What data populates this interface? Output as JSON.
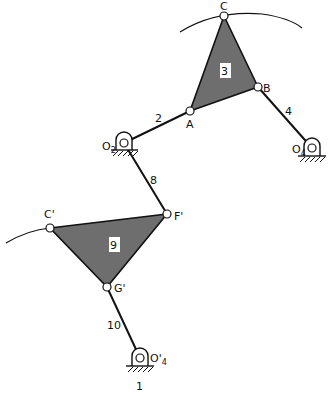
{
  "diagram": {
    "type": "linkage mechanism",
    "colors": {
      "plate_fill": "#6e6e6e",
      "line": "#111111",
      "background": "#ffffff"
    },
    "joints": {
      "C": {
        "label": "C",
        "x": 224,
        "y": 16
      },
      "B": {
        "label": "B",
        "x": 258,
        "y": 87
      },
      "A": {
        "label": "A",
        "x": 190,
        "y": 111
      },
      "O2": {
        "label": "O",
        "sub": "2",
        "x": 124,
        "y": 143
      },
      "O4": {
        "label": "O",
        "sub": "4",
        "x": 312,
        "y": 148
      },
      "F_prime": {
        "label": "F'",
        "x": 167,
        "y": 214
      },
      "C_prime": {
        "label": "C'",
        "x": 50,
        "y": 228
      },
      "G_prime": {
        "label": "G'",
        "x": 107,
        "y": 287
      },
      "O4_prime": {
        "label": "O'",
        "sub": "4",
        "x": 140,
        "y": 358
      }
    },
    "links": [
      {
        "id": "2",
        "label": "2",
        "from": "O2",
        "to": "A"
      },
      {
        "id": "4",
        "label": "4",
        "from": "B",
        "to": "O4"
      },
      {
        "id": "8",
        "label": "8",
        "from": "O2",
        "to": "F_prime"
      },
      {
        "id": "10",
        "label": "10",
        "from": "G_prime",
        "to": "O4_prime"
      }
    ],
    "plates": [
      {
        "id": "3",
        "label": "3",
        "vertices": [
          "A",
          "B",
          "C"
        ]
      },
      {
        "id": "9",
        "label": "9",
        "vertices": [
          "C_prime",
          "F_prime",
          "G_prime"
        ]
      }
    ],
    "ground_label": "1"
  }
}
